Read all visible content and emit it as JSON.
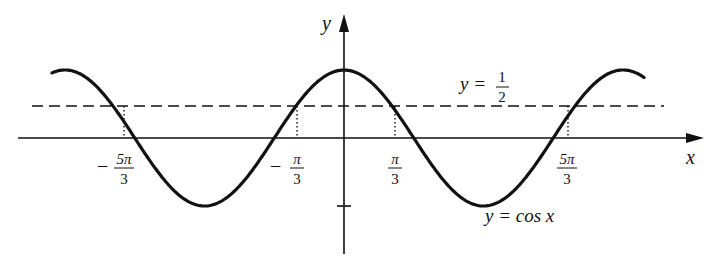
{
  "chart_data": {
    "type": "line",
    "title": "",
    "xlabel": "x",
    "ylabel": "y",
    "series": [
      {
        "name": "y = cos x",
        "function": "cos(x)",
        "x_range": [
          "-2.1π",
          "2.1π"
        ],
        "style": "solid"
      },
      {
        "name": "y = 1/2",
        "function": "0.5",
        "style": "dashed"
      }
    ],
    "intersections": [
      {
        "x_label": "-5π/3",
        "x": -5.236,
        "y": 0.5
      },
      {
        "x_label": "-π/3",
        "x": -1.047,
        "y": 0.5
      },
      {
        "x_label": "π/3",
        "x": 1.047,
        "y": 0.5
      },
      {
        "x_label": "5π/3",
        "x": 5.236,
        "y": 0.5
      }
    ],
    "x_ticks": [
      "-5π/3",
      "-π/3",
      "π/3",
      "5π/3"
    ],
    "y_ticks": [
      -1
    ],
    "ylim": [
      -1.5,
      2
    ],
    "grid": false,
    "legend": false,
    "annotations": [
      "y = 1/2",
      "y = cos x"
    ]
  },
  "labels": {
    "y_axis": "y",
    "x_axis": "x",
    "half_line": "y = ",
    "half_num": "1",
    "half_den": "2",
    "curve": "y = cos x",
    "ticks": [
      {
        "sign": "−",
        "num": "5π",
        "den": "3"
      },
      {
        "sign": "−",
        "num": "π",
        "den": "3"
      },
      {
        "sign": "",
        "num": "π",
        "den": "3"
      },
      {
        "sign": "",
        "num": "5π",
        "den": "3"
      }
    ]
  }
}
